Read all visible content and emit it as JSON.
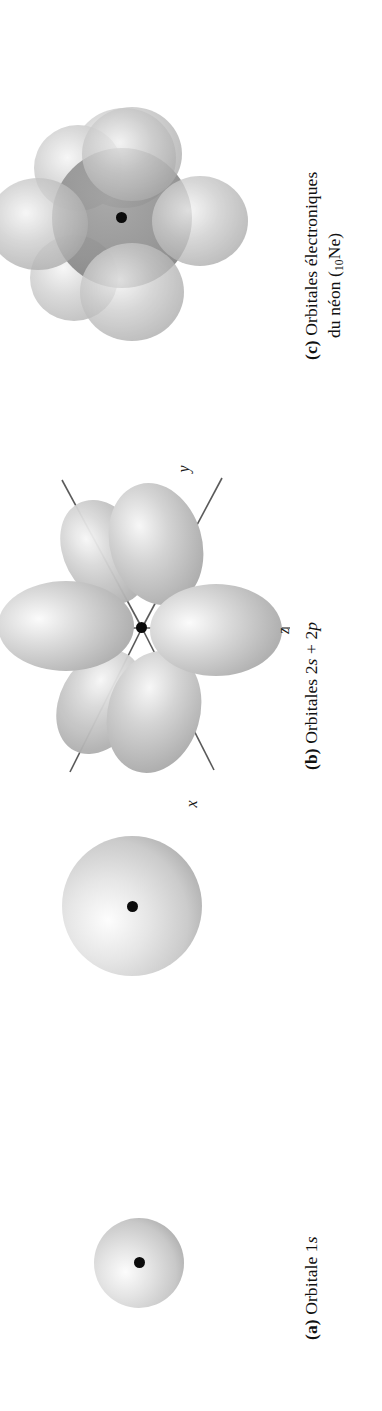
{
  "figure": {
    "background_color": "#ffffff",
    "orientation": "rotated-90-ccw",
    "language": "fr"
  },
  "panels": [
    {
      "id": "c",
      "tag": "(c)",
      "caption_line1": "Orbitales électroniques",
      "caption_line2_prefix": "du néon (",
      "caption_line2_subscript": "10",
      "caption_line2_suffix": "Ne)",
      "caption_plain": "(c) Orbitales électroniques du néon (10Ne)",
      "art": "neon-orbitals",
      "nucleus": "nucleus-dot"
    },
    {
      "id": "b",
      "tag": "(b)",
      "caption_prefix": "Orbitales 2",
      "caption_italic_1": "s",
      "caption_mid": " + 2",
      "caption_italic_2": "p",
      "caption_plain": "(b) Orbitales 2s + 2p",
      "art_sphere": "2s-sphere",
      "art_lobes": "2p-orbital-lobes",
      "axes": [
        {
          "name": "y",
          "label": "y"
        },
        {
          "name": "z",
          "label": "z"
        },
        {
          "name": "x",
          "label": "x"
        }
      ],
      "nucleus": "nucleus-dot"
    },
    {
      "id": "a",
      "tag": "(a)",
      "caption_prefix": "Orbitale 1",
      "caption_italic_1": "s",
      "caption_plain": "(a) Orbitale 1s",
      "art": "1s-sphere",
      "nucleus": "nucleus-dot"
    }
  ],
  "colors": {
    "sphere_light": "#f2f2f2",
    "sphere_mid": "#c9c9c9",
    "sphere_dark": "#a3a3a3",
    "lobe_light": "#efefef",
    "lobe_mid": "#c2c2c2",
    "lobe_edge": "#a8a8a8",
    "neon_core": "#8d8d8d",
    "neon_lobe": "#b4b4b4",
    "axis_line": "#5a5a5a",
    "nucleus": "#0b0b0b",
    "text": "#111111"
  }
}
